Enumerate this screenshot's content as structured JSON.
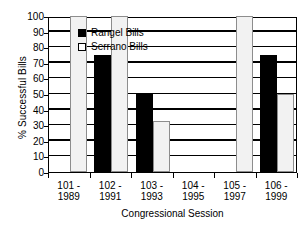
{
  "chart_data": {
    "type": "bar",
    "title": "",
    "xlabel": "Congressional Session",
    "ylabel": "% Successful Bills",
    "categories": [
      "101 - 1989",
      "102 - 1991",
      "103 - 1993",
      "104 - 1995",
      "105 - 1997",
      "106 - 1999"
    ],
    "category_lines": [
      {
        "line1": "101 -",
        "line2": "1989"
      },
      {
        "line1": "102 -",
        "line2": "1991"
      },
      {
        "line1": "103 -",
        "line2": "1993"
      },
      {
        "line1": "104 -",
        "line2": "1995"
      },
      {
        "line1": "105 -",
        "line2": "1997"
      },
      {
        "line1": "106 -",
        "line2": "1999"
      }
    ],
    "series": [
      {
        "name": "Rangel Bills",
        "color": "#000000",
        "values": [
          0,
          75,
          50,
          0,
          0,
          75
        ]
      },
      {
        "name": "Serrano Bills",
        "color": "#f2f2f2",
        "values": [
          100,
          100,
          33,
          0,
          100,
          50
        ]
      }
    ],
    "ylim": [
      0,
      100
    ],
    "yticks": [
      0,
      10,
      20,
      30,
      40,
      50,
      60,
      70,
      80,
      90,
      100
    ],
    "ytick_labels": [
      "0",
      "10",
      "20",
      "30",
      "40",
      "50",
      "60",
      "70",
      "80",
      "90",
      "100"
    ],
    "grid": true,
    "grid_axis": "y",
    "legend_position": "upper-center-inside"
  }
}
